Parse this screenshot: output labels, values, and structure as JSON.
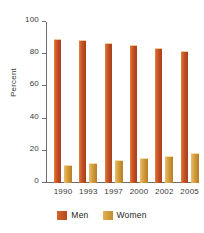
{
  "chart_data": {
    "type": "bar",
    "title": "",
    "subtitle": "",
    "xlabel": "",
    "ylabel": "Percent",
    "categories": [
      "1990",
      "1993",
      "1997",
      "2000",
      "2002",
      "2005"
    ],
    "series": [
      {
        "name": "Men",
        "color": "#c1502a",
        "values": [
          89,
          88,
          86.5,
          85,
          83.5,
          81.5
        ]
      },
      {
        "name": "Women",
        "color": "#d9a441",
        "values": [
          10.5,
          12,
          13.5,
          15,
          16,
          18
        ]
      }
    ],
    "ylim": [
      0,
      100
    ],
    "yticks": [
      0,
      20,
      40,
      60,
      80,
      100
    ],
    "ytick_labels": [
      "0",
      "20",
      "40",
      "60",
      "80",
      "100"
    ],
    "grid": false,
    "legend_position": "bottom"
  },
  "legend": {
    "items": [
      {
        "label": "Men"
      },
      {
        "label": "Women"
      }
    ]
  }
}
